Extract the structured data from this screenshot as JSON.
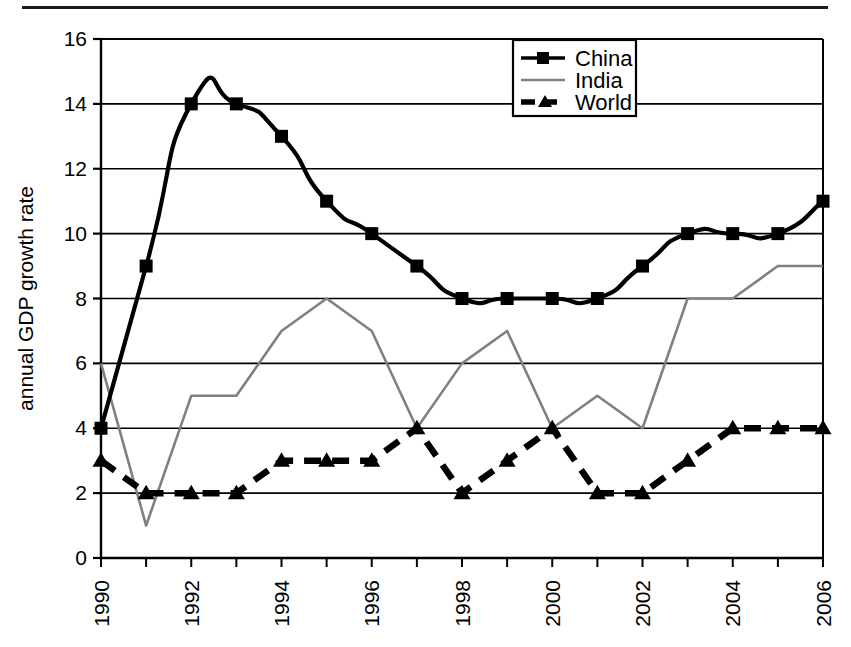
{
  "chart_data": {
    "type": "line",
    "title": "",
    "xlabel": "",
    "ylabel": "annual GDP growth rate",
    "x": [
      1990,
      1991,
      1992,
      1993,
      1994,
      1995,
      1996,
      1997,
      1998,
      1999,
      2000,
      2001,
      2002,
      2003,
      2004,
      2005,
      2006
    ],
    "xlim": [
      1990,
      2006
    ],
    "ylim": [
      0,
      16
    ],
    "ytick_labels": [
      "0",
      "2",
      "4",
      "6",
      "8",
      "10",
      "12",
      "14",
      "16"
    ],
    "ytick_values": [
      0,
      2,
      4,
      6,
      8,
      10,
      12,
      14,
      16
    ],
    "xtick_labels": [
      "1990",
      "",
      "1992",
      "",
      "1994",
      "",
      "1996",
      "",
      "1998",
      "",
      "2000",
      "",
      "2002",
      "",
      "2004",
      "",
      "2006"
    ],
    "xtick_labels_shown": [
      "1990",
      "1992",
      "1994",
      "1996",
      "1998",
      "2000",
      "2002",
      "2004",
      "2006"
    ],
    "xtick_label_rotation": -90,
    "grid": "horizontal",
    "legend_position": "top-center-right",
    "series": [
      {
        "name": "China",
        "color": "#000000",
        "marker": "square",
        "linestyle": "solid",
        "smoothed": true,
        "values": [
          4,
          9,
          14,
          14,
          13,
          11,
          10,
          9,
          8,
          8,
          8,
          8,
          9,
          10,
          10,
          10,
          11
        ]
      },
      {
        "name": "India",
        "color": "#808080",
        "marker": "none",
        "linestyle": "solid",
        "smoothed": false,
        "values": [
          6,
          1,
          5,
          5,
          7,
          8,
          7,
          4,
          6,
          7,
          4,
          5,
          4,
          8,
          8,
          9,
          9
        ]
      },
      {
        "name": "World",
        "color": "#000000",
        "marker": "triangle",
        "linestyle": "dashed",
        "smoothed": false,
        "values": [
          3,
          2,
          2,
          2,
          3,
          3,
          3,
          4,
          2,
          3,
          4,
          2,
          2,
          3,
          4,
          4,
          4
        ]
      }
    ]
  },
  "legend": {
    "entries": [
      {
        "label": "China"
      },
      {
        "label": "India"
      },
      {
        "label": "World"
      }
    ]
  },
  "axes": {
    "y_title": "annual GDP growth rate"
  }
}
